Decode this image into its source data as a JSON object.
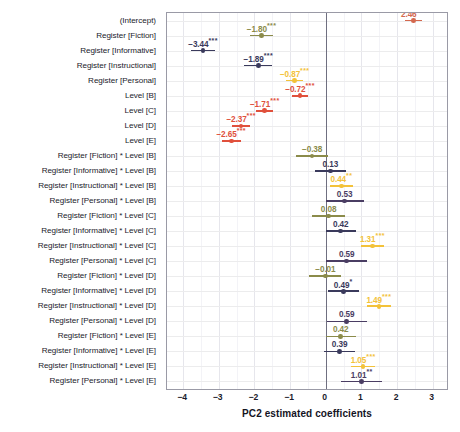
{
  "chart_data": {
    "type": "scatter",
    "title": "",
    "xlabel": "PC2 estimated coefficients",
    "ylabel": "",
    "xlim": [
      -4.45,
      3.4
    ],
    "xticks": [
      -4,
      -3,
      -2,
      -1,
      0,
      1,
      2,
      3
    ],
    "xtick_labels": [
      "−4",
      "−3",
      "−2",
      "−1",
      "0",
      "1",
      "2",
      "3"
    ],
    "grid": true,
    "legend": "none",
    "reference_line": 0,
    "colors": {
      "intercept": "#d4694f",
      "fiction": "#8b8b4a",
      "informative": "#3a3a5c",
      "instructional": "#4a3d63",
      "personal": "#f3c23a",
      "level": "#e0503c",
      "grid": "#e6e6ec",
      "zeroline": "#6f6f80",
      "panel_border": "#9a9aa6",
      "text": "#1b1b2b"
    },
    "terms": [
      {
        "label": "(Intercept)",
        "estimate": 2.46,
        "low": 2.22,
        "high": 2.7,
        "stars": "***",
        "color": "#d4694f",
        "label_side": "left"
      },
      {
        "label": "Register [Fiction]",
        "estimate": -1.8,
        "low": -2.12,
        "high": -1.48,
        "stars": "***",
        "color": "#8b8b4a",
        "label_side": "left"
      },
      {
        "label": "Register [Informative]",
        "estimate": -3.44,
        "low": -3.78,
        "high": -3.1,
        "stars": "***",
        "color": "#3a3a5c",
        "label_side": "left"
      },
      {
        "label": "Register [Instructional]",
        "estimate": -1.89,
        "low": -2.28,
        "high": -1.5,
        "stars": "***",
        "color": "#3a3a5c",
        "label_side": "left"
      },
      {
        "label": "Register [Personal]",
        "estimate": -0.87,
        "low": -1.1,
        "high": -0.64,
        "stars": "***",
        "color": "#f3c23a",
        "label_side": "left"
      },
      {
        "label": "Level [B]",
        "estimate": -0.72,
        "low": -0.95,
        "high": -0.49,
        "stars": "***",
        "color": "#e0503c",
        "label_side": "left"
      },
      {
        "label": "Level [C]",
        "estimate": -1.71,
        "low": -1.95,
        "high": -1.47,
        "stars": "***",
        "color": "#e0503c",
        "label_side": "left"
      },
      {
        "label": "Level [D]",
        "estimate": -2.37,
        "low": -2.62,
        "high": -2.12,
        "stars": "***",
        "color": "#e0503c",
        "label_side": "left"
      },
      {
        "label": "Level [E]",
        "estimate": -2.65,
        "low": -2.92,
        "high": -2.38,
        "stars": "***",
        "color": "#e0503c",
        "label_side": "left"
      },
      {
        "label": "Register [Fiction] * Level [B]",
        "estimate": -0.38,
        "low": -0.82,
        "high": 0.06,
        "stars": "",
        "color": "#8b8b4a",
        "label_side": "center"
      },
      {
        "label": "Register [Informative] * Level [B]",
        "estimate": 0.13,
        "low": -0.3,
        "high": 0.56,
        "stars": "",
        "color": "#3a3a5c",
        "label_side": "center"
      },
      {
        "label": "Register [Instructional] * Level [B]",
        "estimate": 0.44,
        "low": 0.12,
        "high": 0.76,
        "stars": "**",
        "color": "#f3c23a",
        "label_side": "center"
      },
      {
        "label": "Register [Personal] * Level [B]",
        "estimate": 0.53,
        "low": 0.0,
        "high": 1.06,
        "stars": "",
        "color": "#4a3d63",
        "label_side": "center"
      },
      {
        "label": "Register [Fiction] * Level [C]",
        "estimate": 0.08,
        "low": -0.38,
        "high": 0.54,
        "stars": "",
        "color": "#8b8b4a",
        "label_side": "center"
      },
      {
        "label": "Register [Informative] * Level [C]",
        "estimate": 0.42,
        "low": 0.0,
        "high": 0.84,
        "stars": "",
        "color": "#3a3a5c",
        "label_side": "center"
      },
      {
        "label": "Register [Instructional] * Level [C]",
        "estimate": 1.31,
        "low": 0.98,
        "high": 1.64,
        "stars": "***",
        "color": "#f3c23a",
        "label_side": "center"
      },
      {
        "label": "Register [Personal] * Level [C]",
        "estimate": 0.59,
        "low": 0.02,
        "high": 1.16,
        "stars": "",
        "color": "#4a3d63",
        "label_side": "center"
      },
      {
        "label": "Register [Fiction] * Level [D]",
        "estimate": -0.01,
        "low": -0.46,
        "high": 0.44,
        "stars": "",
        "color": "#8b8b4a",
        "label_side": "center"
      },
      {
        "label": "Register [Informative] * Level [D]",
        "estimate": 0.49,
        "low": 0.06,
        "high": 0.92,
        "stars": "*",
        "color": "#3a3a5c",
        "label_side": "center"
      },
      {
        "label": "Register [Instructional] * Level [D]",
        "estimate": 1.49,
        "low": 1.15,
        "high": 1.83,
        "stars": "***",
        "color": "#f3c23a",
        "label_side": "center"
      },
      {
        "label": "Register [Personal] * Level [D]",
        "estimate": 0.59,
        "low": 0.03,
        "high": 1.15,
        "stars": "",
        "color": "#4a3d63",
        "label_side": "center"
      },
      {
        "label": "Register [Fiction] * Level [E]",
        "estimate": 0.42,
        "low": 0.0,
        "high": 0.84,
        "stars": "",
        "color": "#8b8b4a",
        "label_side": "center"
      },
      {
        "label": "Register [Informative] * Level [E]",
        "estimate": 0.39,
        "low": -0.04,
        "high": 0.82,
        "stars": "",
        "color": "#3a3a5c",
        "label_side": "center"
      },
      {
        "label": "Register [Instructional] * Level [E]",
        "estimate": 1.05,
        "low": 0.72,
        "high": 1.38,
        "stars": "***",
        "color": "#f3c23a",
        "label_side": "center"
      },
      {
        "label": "Register [Personal] * Level [E]",
        "estimate": 1.01,
        "low": 0.44,
        "high": 1.58,
        "stars": "**",
        "color": "#4a3d63",
        "label_side": "center"
      }
    ]
  }
}
